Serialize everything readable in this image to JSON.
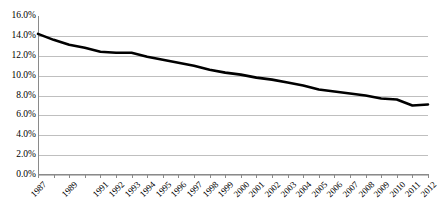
{
  "chart_data": {
    "type": "line",
    "title": "",
    "subtitle": "",
    "xlabel": "",
    "ylabel": "",
    "grid": "horizontal",
    "legend": "none",
    "xlim": [
      1987,
      2012
    ],
    "ylim": [
      0,
      16
    ],
    "y_tick_labels": [
      "16.0%",
      "14.0%",
      "12.0%",
      "10.0%",
      "8.0%",
      "6.0%",
      "4.0%",
      "2.0%",
      "0.0%"
    ],
    "y_tick_values": [
      16,
      14,
      12,
      10,
      8,
      6,
      4,
      2,
      0
    ],
    "x_tick_labels": [
      "1987",
      "1989",
      "1991",
      "1992",
      "1993",
      "1994",
      "1995",
      "1996",
      "1997",
      "1998",
      "1999",
      "2000",
      "2001",
      "2002",
      "2003",
      "2004",
      "2005",
      "2006",
      "2007",
      "2008",
      "2009",
      "2010",
      "2011",
      "2012"
    ],
    "categories": [
      1987,
      1988,
      1989,
      1990,
      1991,
      1992,
      1993,
      1994,
      1995,
      1996,
      1997,
      1998,
      1999,
      2000,
      2001,
      2002,
      2003,
      2004,
      2005,
      2006,
      2007,
      2008,
      2009,
      2010,
      2011,
      2012
    ],
    "values": [
      14.2,
      13.6,
      13.1,
      12.8,
      12.4,
      12.3,
      12.3,
      11.9,
      11.6,
      11.3,
      11.0,
      10.6,
      10.3,
      10.1,
      9.8,
      9.6,
      9.3,
      9.0,
      8.6,
      8.4,
      8.2,
      8.0,
      7.7,
      7.6,
      7.0,
      7.1
    ],
    "series": [
      {
        "name": "",
        "color": "#000000",
        "line_width": 2.6,
        "values": [
          14.2,
          13.6,
          13.1,
          12.8,
          12.4,
          12.3,
          12.3,
          11.9,
          11.6,
          11.3,
          11.0,
          10.6,
          10.3,
          10.1,
          9.8,
          9.6,
          9.3,
          9.0,
          8.6,
          8.4,
          8.2,
          8.0,
          7.7,
          7.6,
          7.0,
          7.1
        ]
      }
    ],
    "annotations": []
  },
  "style": {
    "plot_background": "#ffffff",
    "grid_color": "#bfbfbf",
    "axis_color": "#8a8a8a",
    "text_color": "#000000"
  }
}
